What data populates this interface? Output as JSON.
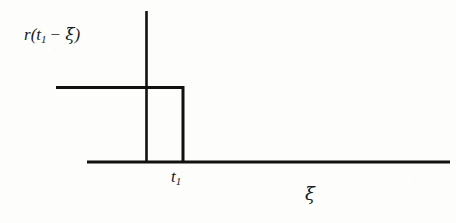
{
  "figure": {
    "type": "plot",
    "background_color": "#fdfdfc",
    "ink_color": "#111111",
    "width": 456,
    "height": 223
  },
  "labels": {
    "ordinate": {
      "full_text": "r(t1 - ξ)",
      "function_name": "r",
      "open_paren": "(",
      "variable": "t",
      "variable_subscript": "1",
      "operator": "−",
      "argument": "ξ",
      "close_paren": ")"
    },
    "abscissa": {
      "full_text": "ξ",
      "symbol": "ξ"
    },
    "tick_t1": {
      "full_text": "t1",
      "variable": "t",
      "subscript": "1"
    }
  },
  "chart_data": {
    "type": "line",
    "title": "",
    "xlabel": "ξ",
    "ylabel": "r(t1 − ξ)",
    "grid": false,
    "legend": false,
    "axes": {
      "y_axis": {
        "x_px": 146,
        "y_top_px": 11,
        "y_bottom_px": 163,
        "arrow": false
      },
      "x_axis": {
        "y_px": 162,
        "x_left_px": 87,
        "x_right_px": 450,
        "arrow": false
      }
    },
    "xticks": [
      {
        "label": "t1",
        "x_px": 183
      }
    ],
    "yticks": [],
    "series": [
      {
        "name": "r(t1 - ξ)",
        "style": "step",
        "color": "#111111",
        "linewidth_px": 3,
        "points_px": [
          {
            "x": 56,
            "y": 87
          },
          {
            "x": 183,
            "y": 87
          },
          {
            "x": 183,
            "y": 162
          },
          {
            "x": 450,
            "y": 162
          }
        ],
        "values": [
          {
            "x": "ξ < t1",
            "y": "A (constant)"
          },
          {
            "x": "ξ = t1",
            "y": "drop to 0"
          },
          {
            "x": "ξ > t1",
            "y": "0"
          }
        ]
      }
    ]
  }
}
